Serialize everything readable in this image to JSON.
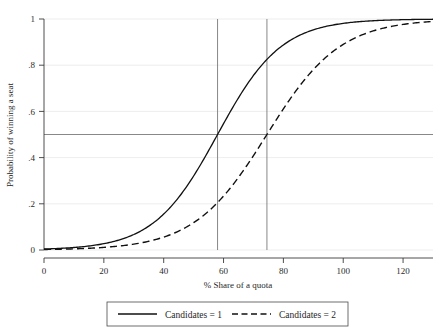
{
  "chart_data": {
    "type": "line",
    "title": "",
    "xlabel": "% Share of a quota",
    "ylabel": "Probability of winning a seat",
    "xlim": [
      0,
      130
    ],
    "ylim": [
      0,
      1
    ],
    "grid": true,
    "legend_position": "bottom",
    "xticks": [
      0,
      20,
      40,
      60,
      80,
      100,
      120
    ],
    "xtick_labels": [
      "0",
      "20",
      "40",
      "60",
      "80",
      "100",
      "120"
    ],
    "yticks": [
      0,
      0.2,
      0.4,
      0.6,
      0.8,
      1
    ],
    "ytick_labels": [
      "0",
      ".2",
      ".4",
      ".6",
      ".8",
      "1"
    ],
    "annotations": {
      "hline_label": "0.5 probability reference",
      "hline_value": 0.5,
      "vline_values": [
        58,
        74.5
      ],
      "vline_labels": [
        "Candidates = 1 threshold (58% of quota)",
        "Candidates = 2 threshold (74.5% of quota)"
      ]
    },
    "series": [
      {
        "name": "Candidates = 1",
        "style": "solid",
        "midpoint": 58,
        "slope": 0.094,
        "x": [
          0,
          5,
          10,
          15,
          20,
          25,
          30,
          35,
          40,
          45,
          50,
          55,
          58,
          60,
          65,
          70,
          75,
          80,
          85,
          90,
          95,
          100,
          105,
          110,
          115,
          120,
          125,
          130
        ],
        "y": [
          0.004,
          0.007,
          0.011,
          0.017,
          0.027,
          0.043,
          0.067,
          0.102,
          0.154,
          0.225,
          0.317,
          0.428,
          0.5,
          0.545,
          0.658,
          0.755,
          0.831,
          0.887,
          0.926,
          0.953,
          0.97,
          0.981,
          0.988,
          0.993,
          0.995,
          0.997,
          0.998,
          0.999
        ]
      },
      {
        "name": "Candidates = 2",
        "style": "dashed",
        "midpoint": 74.5,
        "slope": 0.082,
        "x": [
          0,
          5,
          10,
          15,
          20,
          25,
          30,
          35,
          40,
          45,
          50,
          55,
          60,
          65,
          70,
          74.5,
          80,
          85,
          90,
          95,
          100,
          105,
          110,
          115,
          120,
          125,
          130
        ],
        "y": [
          0.002,
          0.003,
          0.005,
          0.007,
          0.011,
          0.016,
          0.024,
          0.036,
          0.053,
          0.078,
          0.112,
          0.159,
          0.221,
          0.298,
          0.388,
          0.5,
          0.578,
          0.666,
          0.744,
          0.81,
          0.862,
          0.902,
          0.932,
          0.953,
          0.968,
          0.979,
          0.986
        ]
      }
    ]
  },
  "legend": {
    "entries": [
      {
        "label": "Candidates = 1",
        "style": "solid"
      },
      {
        "label": "Candidates = 2",
        "style": "dashed"
      }
    ]
  },
  "colors": {
    "series": "#111111",
    "grid": "#e9e9e9",
    "axis": "#3a3a3a",
    "reference_line": "#7a7a7a",
    "background": "#ffffff"
  }
}
